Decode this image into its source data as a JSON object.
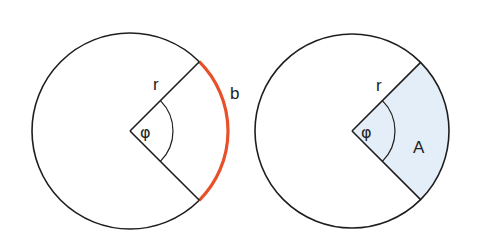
{
  "diagram": {
    "colors": {
      "stroke": "#1e1e1e",
      "arc_highlight": "#e8502a",
      "sector_fill": "#e4eef8",
      "background": "#ffffff"
    },
    "left_figure": {
      "name": "arc-length-figure",
      "circle": {
        "cx": 130,
        "cy": 131,
        "r": 98
      },
      "radius_label": "r",
      "angle_label": "φ",
      "arc_label": "b",
      "highlight": "arc"
    },
    "right_figure": {
      "name": "sector-area-figure",
      "circle": {
        "cx": 352,
        "cy": 131,
        "r": 97
      },
      "radius_label": "r",
      "angle_label": "φ",
      "area_label": "A",
      "highlight": "sector"
    },
    "sector_angle_degrees": 90,
    "angle_marker_radius": 43
  }
}
